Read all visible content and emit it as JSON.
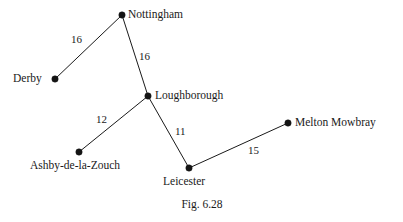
{
  "figure": {
    "caption": "Fig. 6.28",
    "background_color": "#ffffff",
    "ink_color": "#1a1a1a"
  },
  "chart_data": {
    "type": "diagram",
    "subtype": "weighted-undirected-graph",
    "title": "Fig. 6.28",
    "xlabel": "",
    "ylabel": "",
    "grid": false,
    "legend": "none",
    "nodes": [
      {
        "id": "nottingham",
        "label": "Nottingham",
        "x": 122,
        "y": 15,
        "label_x": 128,
        "label_y": 9,
        "label_align": "left"
      },
      {
        "id": "derby",
        "label": "Derby",
        "x": 55,
        "y": 79,
        "label_x": 13,
        "label_y": 73,
        "label_align": "left"
      },
      {
        "id": "loughborough",
        "label": "Loughborough",
        "x": 148,
        "y": 96,
        "label_x": 155,
        "label_y": 90,
        "label_align": "left"
      },
      {
        "id": "ashby",
        "label": "Ashby-de-la-Zouch",
        "x": 79,
        "y": 152,
        "label_x": 30,
        "label_y": 160,
        "label_align": "left"
      },
      {
        "id": "leicester",
        "label": "Leicester",
        "x": 189,
        "y": 168,
        "label_x": 163,
        "label_y": 176,
        "label_align": "left"
      },
      {
        "id": "melton",
        "label": "Melton Mowbray",
        "x": 288,
        "y": 123,
        "label_x": 295,
        "label_y": 117,
        "label_align": "left"
      }
    ],
    "edges": [
      {
        "from": "derby",
        "to": "nottingham",
        "weight": "16",
        "label_x": 71,
        "label_y": 34
      },
      {
        "from": "nottingham",
        "to": "loughborough",
        "weight": "16",
        "label_x": 139,
        "label_y": 51
      },
      {
        "from": "ashby",
        "to": "loughborough",
        "weight": "12",
        "label_x": 96,
        "label_y": 114
      },
      {
        "from": "loughborough",
        "to": "leicester",
        "weight": "11",
        "label_x": 175,
        "label_y": 126
      },
      {
        "from": "leicester",
        "to": "melton",
        "weight": "15",
        "label_x": 248,
        "label_y": 145
      }
    ],
    "node_radius": 3.2,
    "caption_x": 202,
    "caption_y": 199
  }
}
